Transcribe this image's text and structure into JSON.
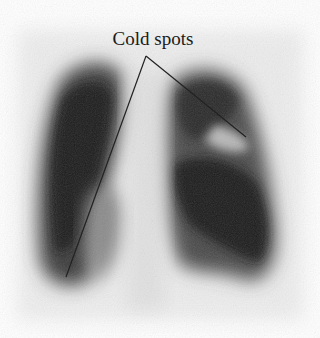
{
  "figure": {
    "annotation_label": "Cold spots",
    "pointer_lines": 2
  }
}
